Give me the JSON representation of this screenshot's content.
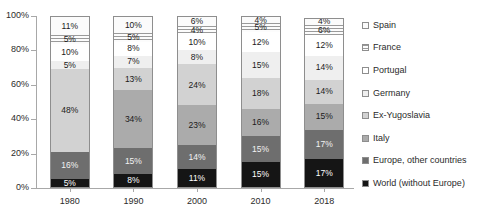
{
  "chart_data": {
    "type": "bar",
    "subtype": "stacked-percent",
    "title": "",
    "xlabel": "",
    "ylabel": "",
    "categories": [
      "1980",
      "1990",
      "2000",
      "2010",
      "2018"
    ],
    "ylim": [
      0,
      100
    ],
    "ytick_labels": [
      "0%",
      "20%",
      "40%",
      "60%",
      "80%",
      "100%"
    ],
    "ytick_values": [
      0,
      20,
      40,
      60,
      80,
      100
    ],
    "grid": false,
    "legend_position": "right",
    "stack_order_bottom_to_top": [
      "World (without Europe)",
      "Europe, other countries",
      "Italy",
      "Ex-Yugoslavia",
      "Germany",
      "Portugal",
      "France",
      "Spain"
    ],
    "series": [
      {
        "name": "Spain",
        "key": "spain",
        "values": [
          11,
          10,
          6,
          4,
          4
        ],
        "labels": [
          "11%",
          "10%",
          "6%",
          "4%",
          "4%"
        ]
      },
      {
        "name": "France",
        "key": "france",
        "values": [
          5,
          5,
          4,
          5,
          6
        ],
        "labels": [
          "5%",
          "5%",
          "4%",
          "5%",
          "6%"
        ]
      },
      {
        "name": "Portugal",
        "key": "portugal",
        "values": [
          10,
          8,
          10,
          12,
          12
        ],
        "labels": [
          "10%",
          "8%",
          "10%",
          "12%",
          "12%"
        ]
      },
      {
        "name": "Germany",
        "key": "germany",
        "values": [
          5,
          7,
          8,
          15,
          14
        ],
        "labels": [
          "5%",
          "7%",
          "8%",
          "15%",
          "14%"
        ]
      },
      {
        "name": "Ex-Yugoslavia",
        "key": "exyugo",
        "values": [
          48,
          13,
          24,
          18,
          14
        ],
        "labels": [
          "48%",
          "13%",
          "24%",
          "18%",
          "14%"
        ]
      },
      {
        "name": "Italy",
        "key": "italy",
        "values": [
          0,
          34,
          23,
          16,
          15
        ],
        "labels": [
          "",
          "34%",
          "23%",
          "16%",
          "15%"
        ]
      },
      {
        "name": "Europe, other countries",
        "key": "europe",
        "values": [
          16,
          15,
          14,
          15,
          17
        ],
        "labels": [
          "16%",
          "15%",
          "14%",
          "15%",
          "17%"
        ]
      },
      {
        "name": "World (without Europe)",
        "key": "world",
        "values": [
          5,
          8,
          11,
          15,
          17
        ],
        "labels": [
          "5%",
          "8%",
          "11%",
          "15%",
          "17%"
        ]
      }
    ]
  },
  "legend": {
    "items": [
      {
        "label": "Spain"
      },
      {
        "label": "France"
      },
      {
        "label": "Portugal"
      },
      {
        "label": "Germany"
      },
      {
        "label": "Ex-Yugoslavia"
      },
      {
        "label": "Italy"
      },
      {
        "label": "Europe, other countries"
      },
      {
        "label": "World (without Europe)"
      }
    ]
  }
}
